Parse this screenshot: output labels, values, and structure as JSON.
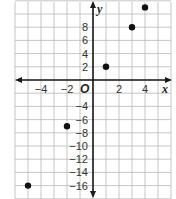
{
  "chart_data": {
    "type": "scatter",
    "title": "",
    "xlabel": "x",
    "ylabel": "y",
    "origin_label": "O",
    "xlim": [
      -6,
      6
    ],
    "ylim": [
      -18,
      11
    ],
    "grid": true,
    "x_ticks": [
      -4,
      -2,
      2,
      4
    ],
    "x_tick_labels": [
      "−4",
      "−2",
      "2",
      "4"
    ],
    "y_ticks": [
      8,
      6,
      4,
      2,
      -4,
      -6,
      -8,
      -10,
      -12,
      -14,
      -16
    ],
    "y_tick_labels": [
      "8",
      "6",
      "4",
      "2",
      "−4",
      "−6",
      "−8",
      "−10",
      "−12",
      "−14",
      "−16"
    ],
    "points": [
      {
        "x": -5,
        "y": -16
      },
      {
        "x": -2,
        "y": -7
      },
      {
        "x": 1,
        "y": 2
      },
      {
        "x": 3,
        "y": 8
      },
      {
        "x": 4,
        "y": 11
      }
    ],
    "colors": {
      "grid": "#b8b8b8",
      "axis": "#1a1a1a",
      "point": "#111111"
    }
  }
}
